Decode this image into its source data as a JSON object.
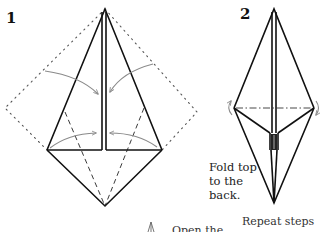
{
  "steps": [
    {
      "number": "1",
      "description": "Kite/bird-base shape with dotted outline of original square; gray curved arrows show edges folding to the center line; dashed valley-fold lines on lower flaps."
    },
    {
      "number": "2",
      "caption_lines": [
        "Fold top",
        "to the",
        "back."
      ],
      "description": "Narrow diamond with dash-dot horizontal mountain-fold line and curved arrows at the side corners."
    }
  ],
  "bottom_text": {
    "left_partial": "Open the",
    "right_partial": "Repeat steps"
  },
  "colors": {
    "line": "#111111",
    "arrow": "#8a8a8a",
    "dotted": "#555555",
    "background": "#ffffff"
  }
}
